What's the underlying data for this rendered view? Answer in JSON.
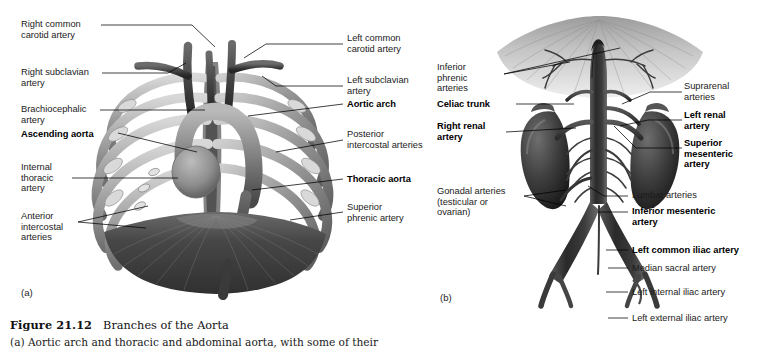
{
  "figure": {
    "number": "Figure 21.12",
    "title": "Branches of the Aorta",
    "caption_line": "(a) Aortic arch and thoracic and abdominal aorta, with some of their"
  },
  "panels": [
    {
      "letter": "(a)",
      "name": "thoracic-aorta-panel",
      "labels_left": [
        {
          "text": "Right common\ncarotid artery",
          "bold": false
        },
        {
          "text": "Right subclavian\nartery",
          "bold": false
        },
        {
          "text": "Brachiocephalic\nartery",
          "bold": false
        },
        {
          "text": "Ascending aorta",
          "bold": true
        },
        {
          "text": "Internal\nthoracic\nartery",
          "bold": false
        },
        {
          "text": "Anterior\nintercostal\narteries",
          "bold": false
        }
      ],
      "labels_right": [
        {
          "text": "Left common\ncarotid artery",
          "bold": false
        },
        {
          "text": "Left subclavian\nartery",
          "bold": false
        },
        {
          "text": "Aortic arch",
          "bold": true
        },
        {
          "text": "Posterior\nintercostal arteries",
          "bold": false
        },
        {
          "text": "Thoracic aorta",
          "bold": true
        },
        {
          "text": "Superior\nphrenic artery",
          "bold": false
        }
      ]
    },
    {
      "letter": "(b)",
      "name": "abdominal-aorta-panel",
      "labels_left": [
        {
          "text": "Inferior\nphrenic\narteries",
          "bold": false
        },
        {
          "text": "Celiac trunk",
          "bold": true
        },
        {
          "text": "Right renal\nartery",
          "bold": true
        },
        {
          "text": "Gonadal arteries\n(testicular or\novarian)",
          "bold": false
        }
      ],
      "labels_right": [
        {
          "text": "Suprarenal\narteries",
          "bold": false
        },
        {
          "text": "Left renal\nartery",
          "bold": true
        },
        {
          "text": "Superior\nmesenteric\nartery",
          "bold": true
        },
        {
          "text": "Lumbar arteries",
          "bold": false
        },
        {
          "text": "Inferior mesenteric\nartery",
          "bold": true
        },
        {
          "text": "Left common iliac artery",
          "bold": true
        },
        {
          "text": "Median sacral artery",
          "bold": false
        },
        {
          "text": "Left internal iliac artery",
          "bold": false
        },
        {
          "text": "Left external iliac artery",
          "bold": false
        }
      ]
    }
  ],
  "colors": {
    "page_background": "#ffffff",
    "leader_line": "#000000",
    "label_text": "#1b1b1b",
    "artwork_dark": "#2e2e2e",
    "artwork_mid": "#7d7d7d",
    "artwork_light": "#c9c9c9"
  }
}
